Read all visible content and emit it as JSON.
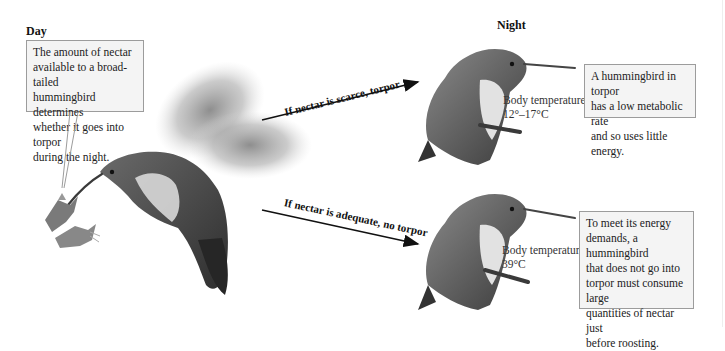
{
  "diagram": {
    "type": "illustrated-flow"
  },
  "day": {
    "heading": "Day",
    "callout": "The amount of nectar available to a broad-tailed hummingbird determines whether it goes into torpor during the night.",
    "callout_lines": [
      "The amount of nectar",
      "available to a broad-tailed",
      "hummingbird determines",
      "whether it goes into torpor",
      "during the night."
    ],
    "illustration": "hovering-hummingbird-feeding-at-flower"
  },
  "night": {
    "heading": "Night",
    "branches": [
      {
        "arrow_label": "If nectar is scarce, torpor",
        "body_temperature_label": "Body temperature",
        "body_temperature_value": "12°–17°C",
        "callout_lines": [
          "A hummingbird in torpor",
          "has a low metabolic rate",
          "and so uses little energy."
        ],
        "illustration": "perched-hummingbird-torpor"
      },
      {
        "arrow_label": "If nectar is adequate, no torpor",
        "body_temperature_label": "Body temperature",
        "body_temperature_value": "39°C",
        "callout_lines": [
          "To meet its energy",
          "demands, a hummingbird",
          "that does not go into",
          "torpor must consume large",
          "quantities of nectar just",
          "before roosting."
        ],
        "illustration": "perched-hummingbird-no-torpor"
      }
    ]
  },
  "colors": {
    "background": "#ffffff",
    "callout_fill": "#f4f4f4",
    "callout_border": "#9c9c9c",
    "text": "#1a1a1a",
    "arrow": "#111111"
  }
}
